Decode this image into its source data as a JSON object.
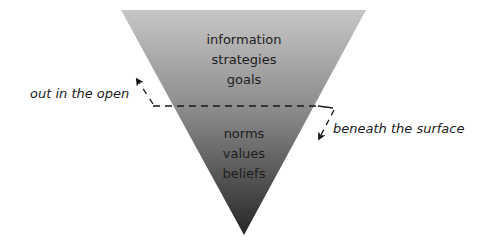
{
  "diagram": {
    "type": "inverted-triangle-iceberg",
    "shape": {
      "top_left": [
        121,
        10
      ],
      "top_right": [
        366,
        10
      ],
      "apex": [
        244,
        235
      ],
      "gradient_top": "#c4c4c4",
      "gradient_bottom": "#2a2a2a"
    },
    "upper_section": {
      "items": [
        "information",
        "strategies",
        "goals"
      ]
    },
    "lower_section": {
      "items": [
        "norms",
        "values",
        "beliefs"
      ]
    },
    "divider": {
      "style": "dashed",
      "y": 106
    },
    "labels": {
      "above": "out in the open",
      "below": "beneath the surface"
    }
  }
}
